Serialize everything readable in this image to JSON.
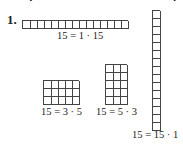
{
  "header": {
    "cutoff_text": "Chapter",
    "cutoff_right": "p"
  },
  "problem": {
    "number": "1."
  },
  "figures": [
    {
      "rows": 1,
      "cols": 15,
      "equation": "15 = 1 · 15"
    },
    {
      "rows": 3,
      "cols": 5,
      "equation": "15 = 3 · 5"
    },
    {
      "rows": 5,
      "cols": 3,
      "equation": "15 = 5 · 3"
    },
    {
      "rows": 15,
      "cols": 1,
      "equation": "15 = 15 · 1"
    }
  ]
}
